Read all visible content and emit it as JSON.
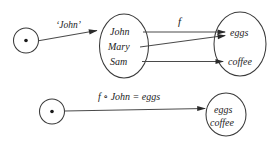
{
  "diagram": {
    "background_color": "#ffffff",
    "stroke_color": "#3a3a3a",
    "text_color": "#232323",
    "rows": [
      {
        "id": "top-row",
        "nodes": [
          {
            "id": "point-source-top",
            "type": "point",
            "label": ""
          },
          {
            "id": "people-set",
            "type": "set",
            "elements": [
              "John",
              "Mary",
              "Sam"
            ]
          },
          {
            "id": "food-set",
            "type": "set",
            "elements": [
              "eggs",
              "coffee"
            ]
          }
        ],
        "edges": [
          {
            "id": "edge-john-select",
            "label": "'John'",
            "from": "point-source-top",
            "to": "people-set"
          },
          {
            "id": "edge-f",
            "label": "f",
            "from": "people-set",
            "to": "food-set"
          },
          {
            "id": "edge-john-eggs",
            "label": "",
            "from": "John",
            "to": "eggs"
          },
          {
            "id": "edge-mary-eggs",
            "label": "",
            "from": "Mary",
            "to": "eggs"
          },
          {
            "id": "edge-sam-coffee",
            "label": "",
            "from": "Sam",
            "to": "coffee"
          }
        ]
      },
      {
        "id": "bottom-row",
        "nodes": [
          {
            "id": "point-source-bottom",
            "type": "point",
            "label": ""
          },
          {
            "id": "food-set-bottom",
            "type": "set",
            "elements": [
              "eggs",
              "coffee"
            ]
          }
        ],
        "edges": [
          {
            "id": "edge-composite",
            "label": "f ∘ John = eggs",
            "from": "point-source-bottom",
            "to": "food-set-bottom"
          }
        ]
      }
    ]
  },
  "labels": {
    "john_quoted": "‘John’",
    "f": "f",
    "composite": "f ∘ John = eggs",
    "john": "John",
    "mary": "Mary",
    "sam": "Sam",
    "eggs": "eggs",
    "coffee": "coffee",
    "eggs_bottom": "eggs",
    "coffee_bottom": "coffee"
  }
}
